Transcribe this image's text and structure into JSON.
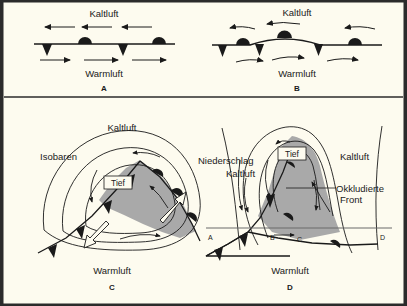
{
  "figure": {
    "background_color": "#fdfbef",
    "ink_color": "#1a1a1a",
    "shading_color": "#a9a9a9",
    "border_color": "#2b2b2b"
  },
  "panels": [
    {
      "id": "A",
      "letter": "A",
      "labels": {
        "cold_air": "Kaltluft",
        "warm_air": "Warmluft"
      },
      "arrows_top": 3,
      "arrows_top_direction": "left",
      "arrows_bottom": 3,
      "arrows_bottom_direction": "right",
      "front_symbols": [
        "cold-triangle",
        "warm-semicircle",
        "cold-triangle",
        "warm-semicircle"
      ]
    },
    {
      "id": "B",
      "letter": "B",
      "labels": {
        "cold_air": "Kaltluft",
        "warm_air": "Warmluft"
      },
      "arrows_top": 3,
      "arrows_top_direction": "left",
      "arrows_bottom": 3,
      "arrows_bottom_direction": "right",
      "front_symbols": [
        "cold-triangle",
        "warm-semicircle",
        "cold-triangle",
        "warm-semicircle",
        "cold-triangle",
        "warm-semicircle"
      ]
    },
    {
      "id": "C",
      "letter": "C",
      "labels": {
        "isobars": "Isobaren",
        "cold_air": "Kaltluft",
        "low": "Tief",
        "precipitation": "Niederschlag",
        "warm_air": "Warmluft"
      }
    },
    {
      "id": "D",
      "letter": "D",
      "labels": {
        "cold_air_left": "Kaltluft",
        "cold_air_right": "Kaltluft",
        "low": "Tief",
        "occluded_front_line1": "Okkludierte",
        "occluded_front_line2": "Front",
        "warm_air": "Warmluft"
      },
      "cross_section_ticks": [
        "A",
        "B",
        "C",
        "D"
      ]
    }
  ]
}
